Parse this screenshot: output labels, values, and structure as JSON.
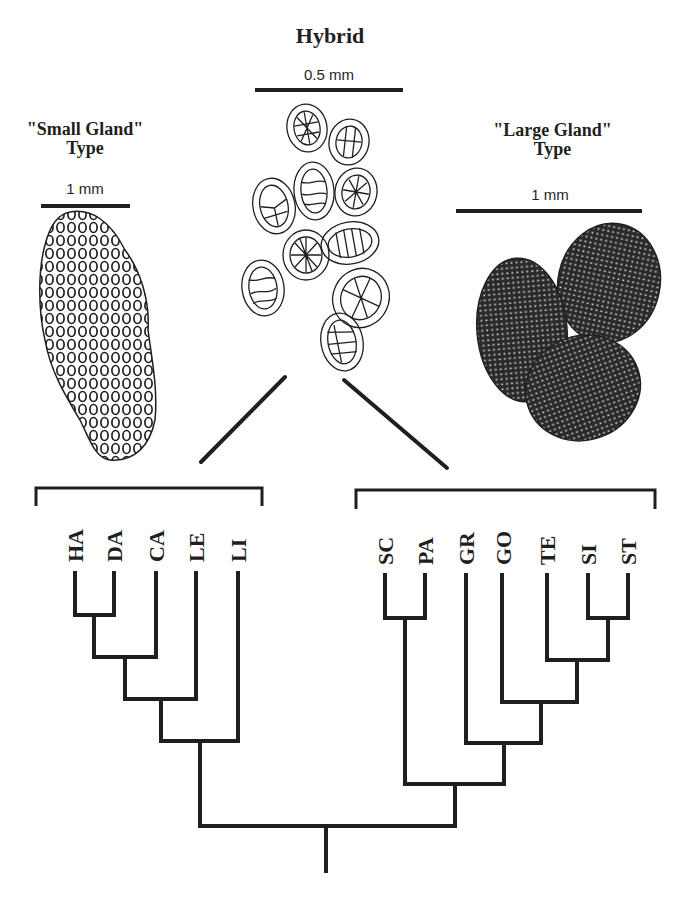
{
  "figure": {
    "hybrid": {
      "title": "Hybrid",
      "scale_label": "0.5 mm"
    },
    "small_gland": {
      "title_line1": "\"Small Gland\"",
      "title_line2": "Type",
      "scale_label": "1 mm"
    },
    "large_gland": {
      "title_line1": "\"Large Gland\"",
      "title_line2": "Type",
      "scale_label": "1 mm"
    }
  },
  "cladogram": {
    "left_clade": {
      "taxa": [
        "HA",
        "DA",
        "CA",
        "LE",
        "LI"
      ],
      "topology": "((((HA,DA),CA),LE),LI)"
    },
    "right_clade": {
      "taxa": [
        "SC",
        "PA",
        "GR",
        "GO",
        "TE",
        "SI",
        "ST"
      ],
      "topology": "((SC,PA),(GR,(GO,(TE,(SI,ST)))))"
    },
    "line_color": "#1f1f1f"
  }
}
